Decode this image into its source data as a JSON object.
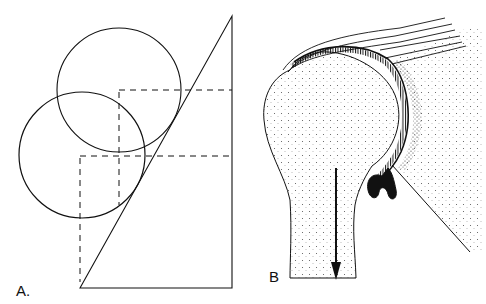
{
  "figure": {
    "panels": [
      {
        "id": "A",
        "label": "A.",
        "description": "Geometric diagram: right triangle with two circles tangent to the hypotenuse, with dashed construction lines from circle centers",
        "elements": {
          "triangle": {
            "vertices": [
              [
                80,
                288
              ],
              [
                232,
                16
              ],
              [
                232,
                288
              ]
            ]
          },
          "circles": [
            {
              "name": "upper-circle",
              "cx": 119,
              "cy": 90,
              "r": 62
            },
            {
              "name": "lower-circle",
              "cx": 82,
              "cy": 155,
              "r": 63
            }
          ],
          "dashed_lines": [
            {
              "x1": 119,
              "y1": 90,
              "x2": 232,
              "y2": 90
            },
            {
              "x1": 119,
              "y1": 90,
              "x2": 119,
              "y2": 205
            },
            {
              "x1": 80,
              "y1": 156,
              "x2": 232,
              "y2": 156
            },
            {
              "x1": 80,
              "y1": 156,
              "x2": 80,
              "y2": 280
            }
          ]
        }
      },
      {
        "id": "B",
        "label": "B",
        "description": "Anatomical illustration of the shoulder joint: humeral head with articular cartilage, glenoid, capsule with inferior recess fold, and downward arrow indicating inferior traction",
        "arrow": {
          "direction": "down",
          "x": 336,
          "y1": 168,
          "y2": 280
        }
      }
    ]
  },
  "colors": {
    "ink": "#111111",
    "background": "#ffffff",
    "stipple": "#555555"
  }
}
